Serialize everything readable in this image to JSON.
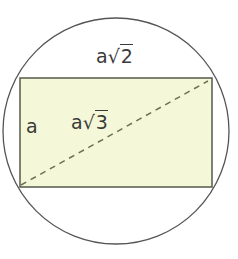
{
  "diagram": {
    "type": "geometry",
    "colors": {
      "circle_stroke": "#555555",
      "rect_fill": "#f4f8d8",
      "rect_stroke": "#555a4a",
      "diagonal": "#6a7055",
      "text": "#3a3a3a"
    },
    "labels": {
      "top": {
        "base": "a",
        "radical": "√",
        "radicand": "2"
      },
      "left": "a",
      "diagonal": {
        "base": "a",
        "radical": "√",
        "radicand": "3"
      }
    }
  }
}
